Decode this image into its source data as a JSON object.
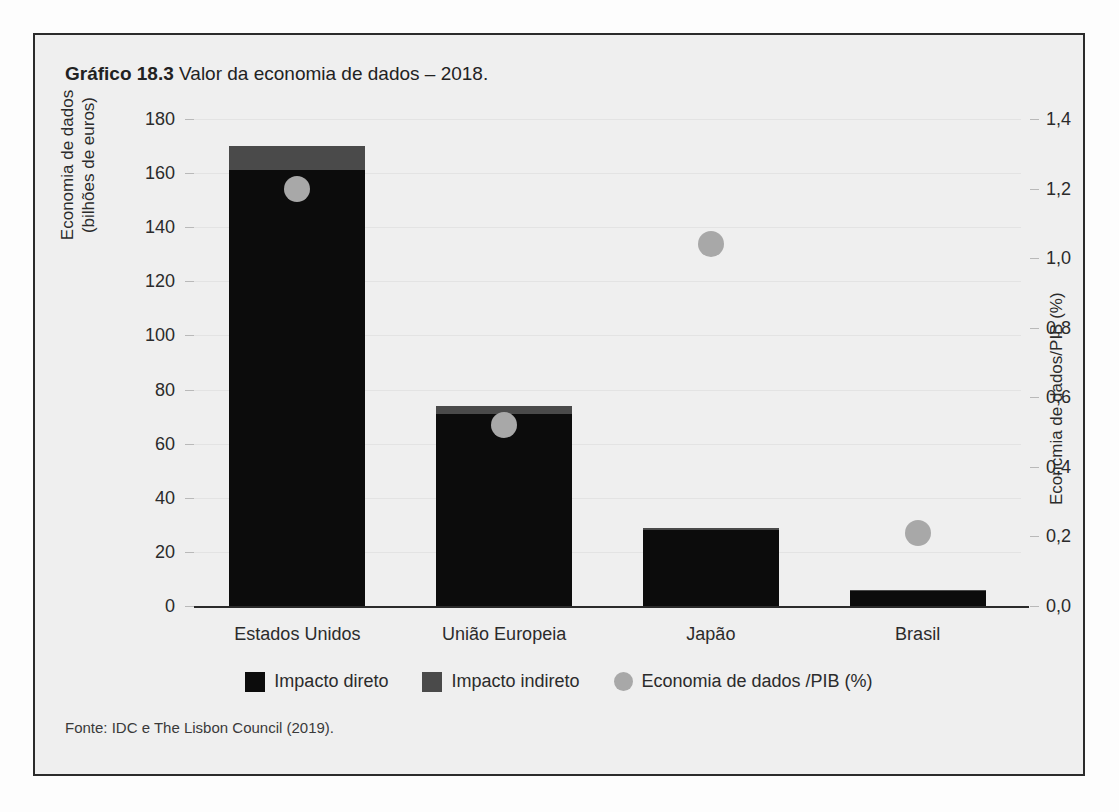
{
  "figure": {
    "caption_strong": "Gráfico 18.3",
    "caption_rest": "Valor da economia de dados – 2018.",
    "source": "Fonte: IDC e The Lisbon Council (2019)."
  },
  "chart_data": {
    "type": "bar",
    "title": "Gráfico 18.3 Valor da economia de dados – 2018.",
    "categories": [
      "Estados Unidos",
      "União Europeia",
      "Japão",
      "Brasil"
    ],
    "series": [
      {
        "name": "Impacto direto",
        "axis": "left",
        "values": [
          161,
          71,
          28,
          5.5
        ],
        "color": "#0c0c0c"
      },
      {
        "name": "Impacto indireto",
        "axis": "left",
        "values": [
          9,
          3,
          1,
          0.5
        ],
        "color": "#4a4a4a"
      },
      {
        "name": "Economia de dados /PIB (%)",
        "axis": "right",
        "type": "scatter",
        "values": [
          1.2,
          0.52,
          1.04,
          0.21
        ],
        "color": "#a8a8a8"
      }
    ],
    "totals": [
      170,
      74,
      29,
      6
    ],
    "stacked": true,
    "xlabel": "",
    "ylabel": "Economia de dados (bilhões de euros)",
    "ylabel_right": "Econcmia de dados/PIB (%)",
    "ylim": [
      0,
      180
    ],
    "ylim_right": [
      0,
      1.4
    ],
    "yticks": [
      0,
      20,
      40,
      60,
      80,
      100,
      120,
      140,
      160,
      180
    ],
    "ytick_labels": [
      "0",
      "20",
      "40",
      "60",
      "80",
      "100",
      "120",
      "140",
      "160",
      "180"
    ],
    "yticks_right": [
      0.0,
      0.2,
      0.4,
      0.6,
      0.8,
      1.0,
      1.2,
      1.4
    ],
    "ytick_labels_right": [
      "0,0",
      "0,2",
      "0,4",
      "0,6",
      "0,8",
      "1,0",
      "1,2",
      "1,4"
    ],
    "grid": true,
    "legend_position": "bottom"
  },
  "axes": {
    "left_title_line1": "Economia de dados",
    "left_title_line2": "(bilhões de euros)",
    "right_title": "Econcmia de dados/PIB (%)"
  },
  "legend": {
    "items": [
      {
        "label": "Impacto direto",
        "marker": "square-black-icon"
      },
      {
        "label": "Impacto indireto",
        "marker": "square-gray-icon"
      },
      {
        "label": "Economia de dados /PIB (%)",
        "marker": "circle-gray-icon"
      }
    ]
  }
}
